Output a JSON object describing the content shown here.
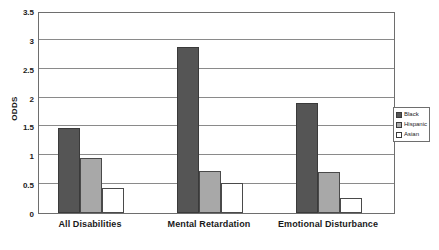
{
  "chart_data": {
    "type": "bar",
    "title": "",
    "subtitle": "",
    "xlabel": "",
    "ylabel": "ODDS",
    "categories": [
      "All Disabilities",
      "Mental Retardation",
      "Emotional Disturbance"
    ],
    "series": [
      {
        "name": "Black",
        "color": "#555555",
        "values": [
          1.48,
          2.87,
          1.9
        ]
      },
      {
        "name": "Hispanic",
        "color": "#a8a8a8",
        "values": [
          0.95,
          0.73,
          0.71
        ]
      },
      {
        "name": "Asian",
        "color": "#ffffff",
        "values": [
          0.44,
          0.52,
          0.26
        ]
      }
    ],
    "ylim": [
      0,
      3.5
    ],
    "yticks": [
      0,
      0.5,
      1,
      1.5,
      2,
      2.5,
      3,
      3.5
    ],
    "ytick_labels": [
      "0",
      "0.5",
      "1",
      "1.5",
      "2",
      "2.5",
      "3",
      "3.5"
    ],
    "grid": true,
    "legend_position": "right-middle",
    "legend_entries": [
      "Black",
      "Hispanic",
      "Asian"
    ],
    "annotations": []
  },
  "legend": {
    "items": [
      {
        "label": "Black"
      },
      {
        "label": "Hispanic"
      },
      {
        "label": "Asian"
      }
    ]
  }
}
